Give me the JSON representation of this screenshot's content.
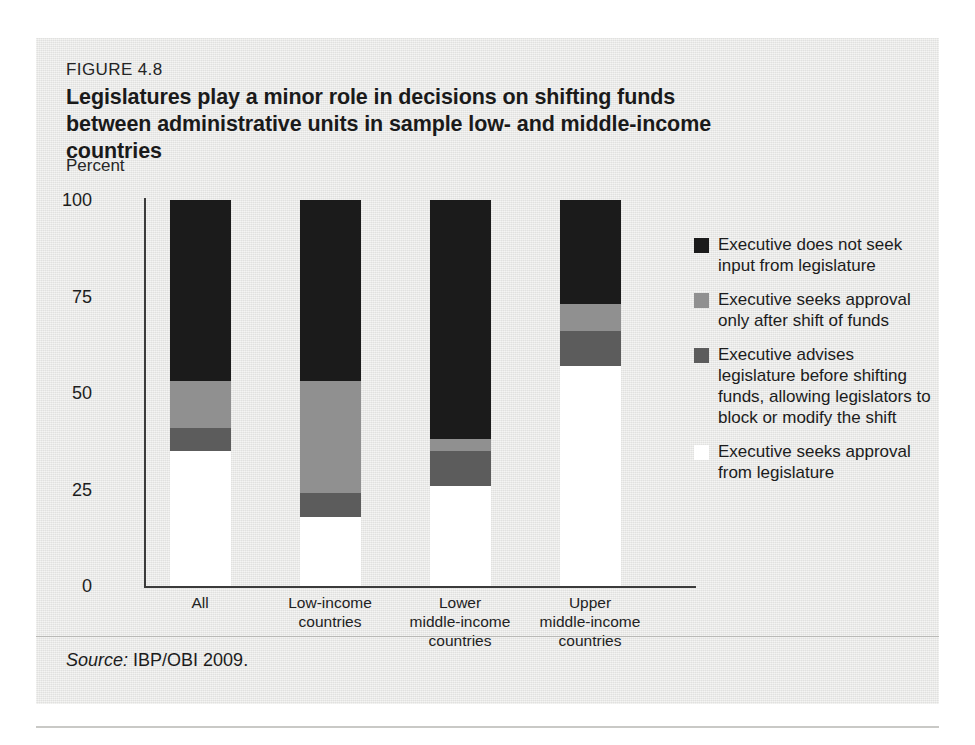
{
  "figure": {
    "label": "FIGURE 4.8",
    "title": "Legislatures play a minor role in decisions on shifting funds between administrative units in sample low- and middle-income countries",
    "axis_unit": "Percent",
    "source_label": "Source:",
    "source_value": "IBP/OBI 2009."
  },
  "colors": {
    "black": "#1b1b1b",
    "gray": "#909090",
    "darkgray": "#5c5c5c",
    "white": "#ffffff",
    "panel": "#e9e9e7",
    "axis": "#3b3b3b"
  },
  "legend": [
    {
      "swatch": "black",
      "text": "Executive does not seek input from legislature"
    },
    {
      "swatch": "gray",
      "text": "Executive seeks approval only after shift of funds"
    },
    {
      "swatch": "darkgray",
      "text": "Executive advises legislature before shifting funds, allowing legislators to block or modify the shift"
    },
    {
      "swatch": "white",
      "text": "Executive seeks approval from legislature"
    }
  ],
  "chart_data": {
    "type": "bar",
    "stacked": true,
    "title": "Legislatures play a minor role in decisions on shifting funds between administrative units in sample low- and middle-income countries",
    "xlabel": "",
    "ylabel": "Percent",
    "ylim": [
      0,
      100
    ],
    "yticks": [
      0,
      25,
      50,
      75,
      100
    ],
    "ytick_labels": [
      "0",
      "25",
      "50",
      "75",
      "100"
    ],
    "grid": false,
    "legend_position": "right",
    "categories": [
      "All",
      "Low-income countries",
      "Lower middle-income countries",
      "Upper middle-income countries"
    ],
    "category_lines": [
      [
        "All"
      ],
      [
        "Low-income",
        "countries"
      ],
      [
        "Lower",
        "middle-income",
        "countries"
      ],
      [
        "Upper",
        "middle-income",
        "countries"
      ]
    ],
    "series": [
      {
        "name": "Executive seeks approval from legislature",
        "key": "white",
        "values": [
          35,
          18,
          26,
          57
        ]
      },
      {
        "name": "Executive advises legislature before shifting funds, allowing legislators to block or modify the shift",
        "key": "darkgray",
        "values": [
          6,
          6,
          9,
          9
        ]
      },
      {
        "name": "Executive seeks approval only after shift of funds",
        "key": "gray",
        "values": [
          12,
          29,
          3,
          7
        ]
      },
      {
        "name": "Executive does not seek input from legislature",
        "key": "black",
        "values": [
          47,
          47,
          62,
          27
        ]
      }
    ]
  }
}
